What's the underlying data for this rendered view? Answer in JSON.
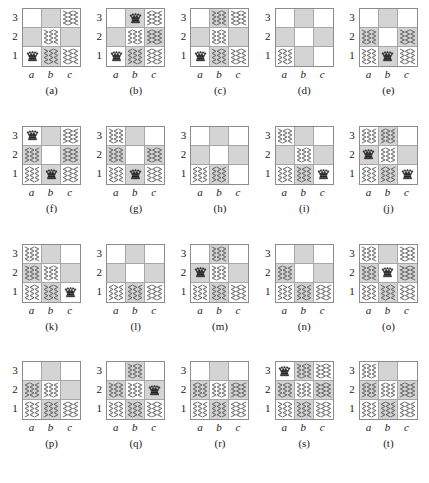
{
  "figure": {
    "rows": 4,
    "cols": 5,
    "board_size": 3,
    "file_labels": [
      "a",
      "b",
      "c"
    ],
    "rank_labels": [
      "3",
      "2",
      "1"
    ],
    "piece_glyph": "♛",
    "piece_name": "queen",
    "colors": {
      "dark_square": "#d4d4d4",
      "light_square": "#ffffff",
      "border": "#8c8c8c",
      "grid_line": "#a6a6a6",
      "hatch_stroke": "#555555",
      "text": "#1a1a1a"
    }
  },
  "boards": [
    {
      "caption": "(a)",
      "queens": [
        "a1"
      ],
      "hatched": [
        "c3",
        "b2",
        "b1",
        "c1"
      ]
    },
    {
      "caption": "(b)",
      "queens": [
        "b3",
        "a1"
      ],
      "hatched": [
        "c3",
        "b2",
        "c2",
        "b1",
        "c1"
      ]
    },
    {
      "caption": "(c)",
      "queens": [
        "a1"
      ],
      "hatched": [
        "b3",
        "c3",
        "b2",
        "b1",
        "c1"
      ]
    },
    {
      "caption": "(d)",
      "queens": [],
      "hatched": [
        "a1"
      ]
    },
    {
      "caption": "(e)",
      "queens": [
        "b1"
      ],
      "hatched": [
        "a2",
        "c2",
        "a1",
        "c1"
      ]
    },
    {
      "caption": "(f)",
      "queens": [
        "a3",
        "b1"
      ],
      "hatched": [
        "c3",
        "a2",
        "c2",
        "a1",
        "c1"
      ]
    },
    {
      "caption": "(g)",
      "queens": [
        "b1"
      ],
      "hatched": [
        "a3",
        "a2",
        "c2",
        "a1",
        "c1"
      ]
    },
    {
      "caption": "(h)",
      "queens": [],
      "hatched": [
        "a1",
        "b1"
      ]
    },
    {
      "caption": "(i)",
      "queens": [
        "c1"
      ],
      "hatched": [
        "a3",
        "b2",
        "a1",
        "b1"
      ]
    },
    {
      "caption": "(j)",
      "queens": [
        "a2",
        "c1"
      ],
      "hatched": [
        "a3",
        "b3",
        "b2",
        "a1",
        "b1"
      ]
    },
    {
      "caption": "(k)",
      "queens": [
        "c1"
      ],
      "hatched": [
        "a3",
        "a2",
        "b2",
        "a1",
        "b1"
      ]
    },
    {
      "caption": "(l)",
      "queens": [],
      "hatched": [
        "a1",
        "b1",
        "c1"
      ]
    },
    {
      "caption": "(m)",
      "queens": [
        "a2"
      ],
      "hatched": [
        "b3",
        "b2",
        "a1",
        "b1",
        "c1"
      ]
    },
    {
      "caption": "(n)",
      "queens": [],
      "hatched": [
        "a2",
        "a1",
        "b1",
        "c1"
      ]
    },
    {
      "caption": "(o)",
      "queens": [
        "b2"
      ],
      "hatched": [
        "a3",
        "c3",
        "a2",
        "c2",
        "a1",
        "b1",
        "c1"
      ]
    },
    {
      "caption": "(p)",
      "queens": [],
      "hatched": [
        "a2",
        "b2",
        "a1",
        "b1",
        "c1"
      ]
    },
    {
      "caption": "(q)",
      "queens": [
        "c2"
      ],
      "hatched": [
        "b3",
        "a2",
        "b2",
        "a1",
        "b1",
        "c1"
      ]
    },
    {
      "caption": "(r)",
      "queens": [],
      "hatched": [
        "a2",
        "b2",
        "c2",
        "a1",
        "b1",
        "c1"
      ]
    },
    {
      "caption": "(s)",
      "queens": [
        "a3"
      ],
      "hatched": [
        "b3",
        "c3",
        "a2",
        "b2",
        "c2",
        "a1",
        "b1",
        "c1"
      ]
    },
    {
      "caption": "(t)",
      "queens": [],
      "hatched": [
        "a3",
        "a2",
        "b2",
        "c2",
        "a1",
        "b1",
        "c1"
      ]
    }
  ]
}
